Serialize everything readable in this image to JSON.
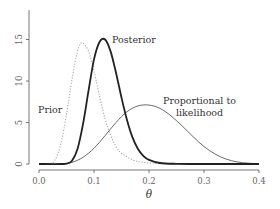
{
  "chart_data": {
    "type": "line",
    "title": "",
    "xlabel": "θ",
    "ylabel": "",
    "xlim": [
      0.0,
      0.4
    ],
    "ylim": [
      0,
      16
    ],
    "grid": false,
    "legend": null,
    "x_ticks": [
      "0.0",
      "0.1",
      "0.2",
      "0.3",
      "0.4"
    ],
    "y_ticks": [
      "0",
      "5",
      "10",
      "15"
    ],
    "series": [
      {
        "name": "Prior",
        "style": "dotted",
        "color": "#aaaaaa",
        "x": [
          0.0,
          0.02,
          0.03,
          0.04,
          0.05,
          0.06,
          0.07,
          0.078,
          0.09,
          0.1,
          0.11,
          0.12,
          0.13,
          0.14,
          0.15,
          0.17,
          0.19,
          0.22,
          0.26,
          0.3,
          0.35,
          0.4
        ],
        "y": [
          0.0,
          0.05,
          0.6,
          2.5,
          6.0,
          10.2,
          13.6,
          14.6,
          13.6,
          11.2,
          8.2,
          5.5,
          3.5,
          2.1,
          1.3,
          0.5,
          0.2,
          0.05,
          0.01,
          0.0,
          0.0,
          0.0
        ]
      },
      {
        "name": "Posterior",
        "style": "solid-thick",
        "color": "#222222",
        "x": [
          0.0,
          0.04,
          0.05,
          0.06,
          0.07,
          0.08,
          0.09,
          0.1,
          0.11,
          0.12,
          0.13,
          0.14,
          0.15,
          0.16,
          0.17,
          0.18,
          0.19,
          0.2,
          0.22,
          0.25,
          0.3,
          0.35,
          0.4
        ],
        "y": [
          0.0,
          0.0,
          0.05,
          0.4,
          1.8,
          4.8,
          8.8,
          12.6,
          14.7,
          15.0,
          13.6,
          11.0,
          8.0,
          5.3,
          3.2,
          1.8,
          0.95,
          0.5,
          0.12,
          0.02,
          0.0,
          0.0,
          0.0
        ]
      },
      {
        "name": "Proportional to likelihood",
        "style": "solid-thin",
        "color": "#444444",
        "x": [
          0.0,
          0.04,
          0.06,
          0.08,
          0.1,
          0.12,
          0.14,
          0.16,
          0.18,
          0.2,
          0.22,
          0.24,
          0.26,
          0.28,
          0.3,
          0.32,
          0.34,
          0.36,
          0.38,
          0.4
        ],
        "y": [
          0.0,
          0.0,
          0.2,
          0.8,
          1.9,
          3.4,
          5.0,
          6.3,
          7.0,
          7.1,
          6.7,
          5.8,
          4.6,
          3.3,
          2.1,
          1.2,
          0.6,
          0.25,
          0.1,
          0.03
        ]
      }
    ],
    "annotations": [
      {
        "text": "Prior",
        "x": 0.0,
        "y": 6.5
      },
      {
        "text": "Posterior",
        "x": 0.138,
        "y": 15.0
      },
      {
        "text": "Proportional to",
        "x": 0.235,
        "y": 7.3
      },
      {
        "text": "likelihood",
        "x": 0.255,
        "y": 5.8
      }
    ]
  },
  "labels": {
    "prior": "Prior",
    "posterior": "Posterior",
    "likelihood_line1": "Proportional to",
    "likelihood_line2": "likelihood",
    "xlabel": "θ",
    "x_ticks": [
      "0.0",
      "0.1",
      "0.2",
      "0.3",
      "0.4"
    ],
    "y_ticks": [
      "0",
      "5",
      "10",
      "15"
    ]
  }
}
